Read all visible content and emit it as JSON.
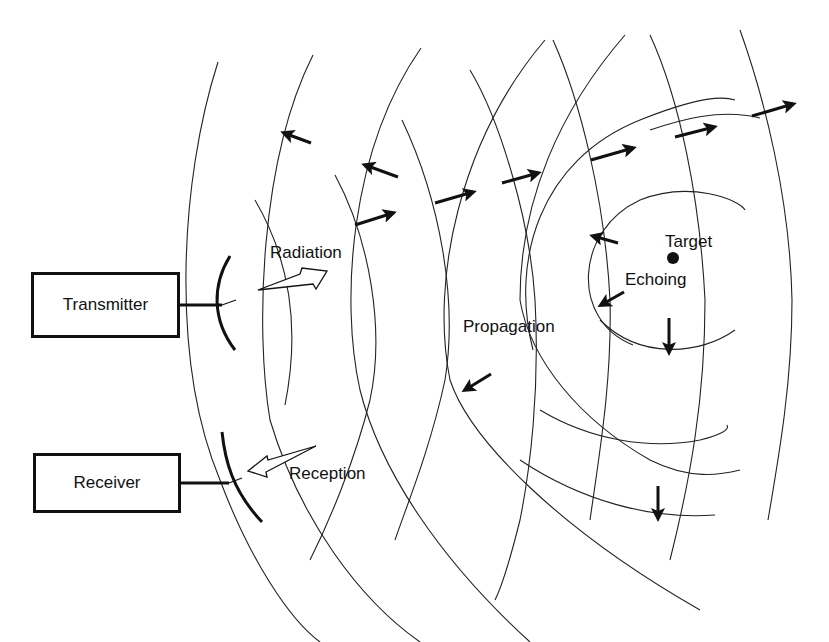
{
  "diagram": {
    "blocks": [
      {
        "id": "transmitter",
        "label": "Transmitter"
      },
      {
        "id": "receiver",
        "label": "Receiver"
      }
    ],
    "labels": {
      "radiation": "Radiation",
      "propagation": "Propagation",
      "target": "Target",
      "echoing": "Echoing",
      "reception": "Reception"
    },
    "colors": {
      "ink": "#111111",
      "background": "#ffffff"
    },
    "edges": [
      {
        "from": "transmitter",
        "to": "antenna-tx",
        "type": "line"
      },
      {
        "from": "receiver",
        "to": "antenna-rx",
        "type": "line"
      },
      {
        "from": "antenna-tx",
        "to": "target",
        "label": "Radiation / Propagation",
        "type": "outgoing-wavefronts"
      },
      {
        "from": "target",
        "to": "antenna-rx",
        "label": "Echoing / Reception",
        "type": "return-wavefronts"
      }
    ]
  }
}
